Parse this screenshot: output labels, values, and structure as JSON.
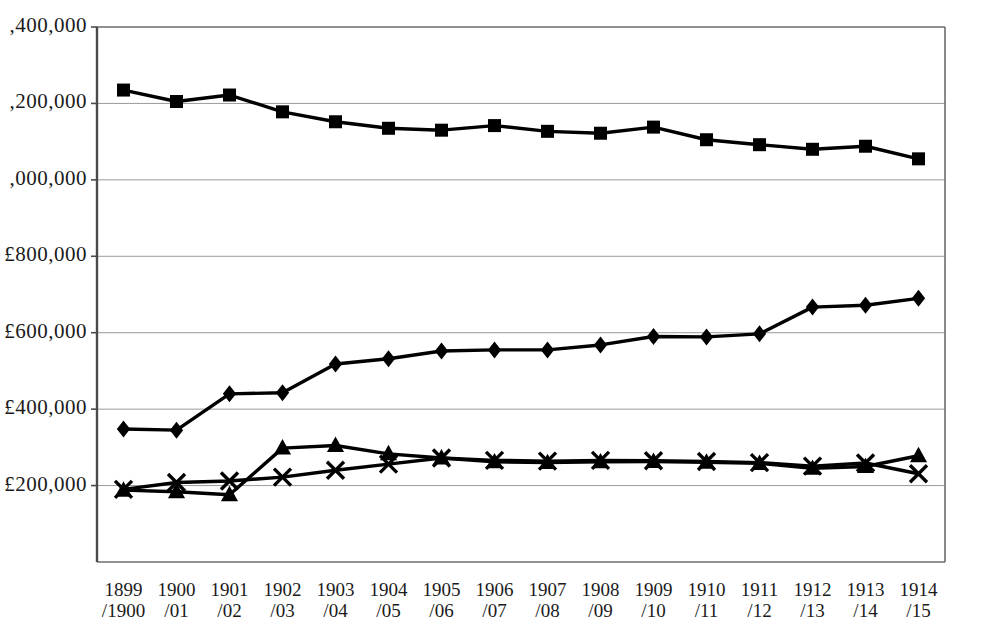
{
  "chart_data": {
    "type": "line",
    "title": "",
    "xlabel": "",
    "ylabel": "",
    "grid": true,
    "legend_position": "none",
    "ylim": [
      0,
      1400000
    ],
    "ytick_step": 200000,
    "yticks": [
      {
        "value": 1400000,
        "label": ",400,000"
      },
      {
        "value": 1200000,
        "label": ",200,000"
      },
      {
        "value": 1000000,
        "label": ",000,000"
      },
      {
        "value": 800000,
        "label": "£800,000"
      },
      {
        "value": 600000,
        "label": "£600,000"
      },
      {
        "value": 400000,
        "label": "£400,000"
      },
      {
        "value": 200000,
        "label": "£200,000"
      }
    ],
    "categories": [
      "1899/1900",
      "1900/01",
      "1901/02",
      "1902/03",
      "1903/04",
      "1904/05",
      "1905/06",
      "1906/07",
      "1907/08",
      "1908/09",
      "1909/10",
      "1910/11",
      "1911/12",
      "1912/13",
      "1913/14",
      "1914/15"
    ],
    "xtick_lines": [
      [
        "1899",
        "/1900"
      ],
      [
        "1900",
        "/01"
      ],
      [
        "1901",
        "/02"
      ],
      [
        "1902",
        "/03"
      ],
      [
        "1903",
        "/04"
      ],
      [
        "1904",
        "/05"
      ],
      [
        "1905",
        "/06"
      ],
      [
        "1906",
        "/07"
      ],
      [
        "1907",
        "/08"
      ],
      [
        "1908",
        "/09"
      ],
      [
        "1909",
        "/10"
      ],
      [
        "1910",
        "/11"
      ],
      [
        "1911",
        "/12"
      ],
      [
        "1912",
        "/13"
      ],
      [
        "1913",
        "/14"
      ],
      [
        "1914",
        "/15"
      ]
    ],
    "series": [
      {
        "name": "series-square",
        "marker": "square",
        "color": "#000000",
        "values": [
          1235000,
          1205000,
          1222000,
          1178000,
          1152000,
          1135000,
          1130000,
          1142000,
          1127000,
          1122000,
          1138000,
          1105000,
          1092000,
          1080000,
          1088000,
          1055000
        ]
      },
      {
        "name": "series-diamond",
        "marker": "diamond",
        "color": "#000000",
        "values": [
          348000,
          345000,
          440000,
          443000,
          518000,
          532000,
          552000,
          555000,
          555000,
          568000,
          590000,
          589000,
          597000,
          667000,
          672000,
          690000
        ]
      },
      {
        "name": "series-triangle",
        "marker": "triangle",
        "color": "#000000",
        "values": [
          188000,
          184000,
          176000,
          298000,
          305000,
          283000,
          272000,
          262000,
          260000,
          262000,
          263000,
          261000,
          258000,
          245000,
          250000,
          278000
        ]
      },
      {
        "name": "series-cross",
        "marker": "cross",
        "color": "#000000",
        "values": [
          190000,
          208000,
          212000,
          222000,
          240000,
          256000,
          272000,
          266000,
          264000,
          266000,
          265000,
          263000,
          260000,
          251000,
          259000,
          231000
        ]
      }
    ]
  }
}
